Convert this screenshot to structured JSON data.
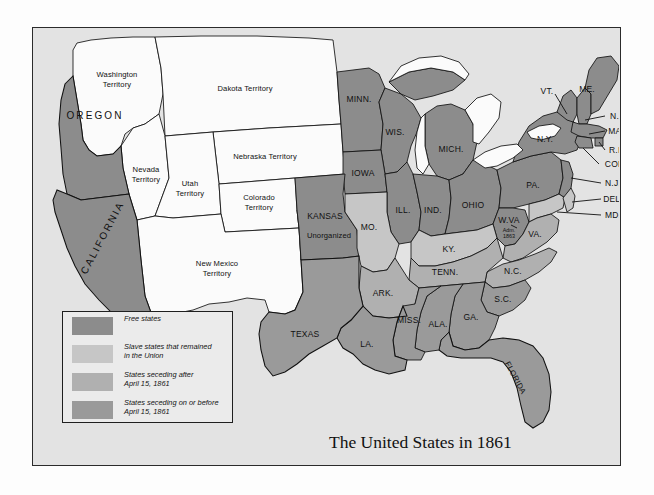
{
  "title": "The United States in 1861",
  "colors": {
    "page_background": "#fdfdfd",
    "panel_background": "#e3e3e3",
    "panel_border": "#2b2b2b",
    "free_states": "#8c8c8c",
    "union_slave_states": "#c6c6c6",
    "seceded_after": "#b0b0b0",
    "seceded_on_or_before": "#9a9a9a",
    "territory": "#fbfbfb",
    "lakes": "#fbfbfb",
    "label_text": "#111111"
  },
  "legend": {
    "items": [
      {
        "label": "Free states",
        "color_key": "free_states",
        "color": "#8c8c8c"
      },
      {
        "label": "Slave states that remained\nin the Union",
        "color_key": "union_slave_states",
        "color": "#c6c6c6"
      },
      {
        "label": "States seceding after\nApril 15, 1861",
        "color_key": "seceded_after",
        "color": "#b0b0b0"
      },
      {
        "label": "States seceding on or before\nApril 15, 1861",
        "color_key": "seceded_on_or_before",
        "color": "#9a9a9a"
      }
    ]
  },
  "map": {
    "territories": [
      {
        "name": "washington-territory",
        "label": "Washington\nTerritory"
      },
      {
        "name": "dakota-territory",
        "label": "Dakota Territory"
      },
      {
        "name": "nebraska-territory",
        "label": "Nebraska Territory"
      },
      {
        "name": "nevada-territory",
        "label": "Nevada\nTerritory"
      },
      {
        "name": "utah-territory",
        "label": "Utah\nTerritory"
      },
      {
        "name": "colorado-territory",
        "label": "Colorado\nTerritory"
      },
      {
        "name": "new-mexico-territory",
        "label": "New Mexico\nTerritory"
      },
      {
        "name": "unorganized-territory",
        "label": "Unorganized"
      }
    ],
    "states": [
      {
        "name": "oregon",
        "label": "OREGON",
        "category": "free_states"
      },
      {
        "name": "california",
        "label": "CALIFORNIA",
        "category": "free_states"
      },
      {
        "name": "minnesota",
        "label": "MINN.",
        "category": "free_states"
      },
      {
        "name": "wisconsin",
        "label": "WIS.",
        "category": "free_states"
      },
      {
        "name": "michigan",
        "label": "MICH.",
        "category": "free_states"
      },
      {
        "name": "iowa",
        "label": "IOWA",
        "category": "free_states"
      },
      {
        "name": "illinois",
        "label": "ILL.",
        "category": "free_states"
      },
      {
        "name": "indiana",
        "label": "IND.",
        "category": "free_states"
      },
      {
        "name": "ohio",
        "label": "OHIO",
        "category": "free_states"
      },
      {
        "name": "pennsylvania",
        "label": "PA.",
        "category": "free_states"
      },
      {
        "name": "new-york",
        "label": "N.Y.",
        "category": "free_states"
      },
      {
        "name": "vermont",
        "label": "VT.",
        "category": "free_states"
      },
      {
        "name": "maine",
        "label": "ME.",
        "category": "free_states"
      },
      {
        "name": "new-hampshire",
        "label": "N.H.",
        "category": "free_states"
      },
      {
        "name": "massachusetts",
        "label": "MASS.",
        "category": "free_states"
      },
      {
        "name": "rhode-island",
        "label": "R.I.",
        "category": "free_states"
      },
      {
        "name": "connecticut",
        "label": "CONN.",
        "category": "free_states"
      },
      {
        "name": "new-jersey",
        "label": "N.J.",
        "category": "free_states"
      },
      {
        "name": "kansas",
        "label": "KANSAS",
        "category": "free_states"
      },
      {
        "name": "west-virginia",
        "label": "W.VA",
        "category": "free_states",
        "note": "Adm.\n1863"
      },
      {
        "name": "delaware",
        "label": "DEL.",
        "category": "union_slave_states"
      },
      {
        "name": "maryland",
        "label": "MD.",
        "category": "union_slave_states"
      },
      {
        "name": "missouri",
        "label": "MO.",
        "category": "union_slave_states"
      },
      {
        "name": "kentucky",
        "label": "KY.",
        "category": "union_slave_states"
      },
      {
        "name": "virginia",
        "label": "VA.",
        "category": "seceded_after"
      },
      {
        "name": "north-carolina",
        "label": "N.C.",
        "category": "seceded_after"
      },
      {
        "name": "tennessee",
        "label": "TENN.",
        "category": "seceded_after"
      },
      {
        "name": "arkansas",
        "label": "ARK.",
        "category": "seceded_after"
      },
      {
        "name": "south-carolina",
        "label": "S.C.",
        "category": "seceded_on_or_before"
      },
      {
        "name": "georgia",
        "label": "GA.",
        "category": "seceded_on_or_before"
      },
      {
        "name": "florida",
        "label": "FLORIDA",
        "category": "seceded_on_or_before"
      },
      {
        "name": "alabama",
        "label": "ALA.",
        "category": "seceded_on_or_before"
      },
      {
        "name": "mississippi",
        "label": "MISS.",
        "category": "seceded_on_or_before"
      },
      {
        "name": "louisiana",
        "label": "LA.",
        "category": "seceded_on_or_before"
      },
      {
        "name": "texas",
        "label": "TEXAS",
        "category": "seceded_on_or_before"
      }
    ]
  }
}
